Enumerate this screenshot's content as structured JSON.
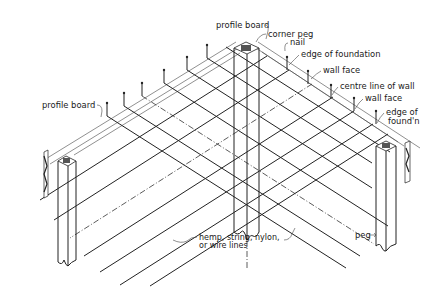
{
  "figure": {
    "type": "isometric construction diagram"
  },
  "labels": {
    "profile_board_top": "profile board",
    "corner_peg": "corner peg",
    "nail": "nail",
    "edge_of_foundation": "edge of foundation",
    "wall_face_1": "wall face",
    "centre_line_of_wall": "centre line of wall",
    "wall_face_2": "wall face",
    "edge_of_foundn_line1": "edge of",
    "edge_of_foundn_line2": "found'n",
    "profile_board_left": "profile board",
    "lines_line1": "hemp, string, nylon,",
    "lines_line2": "or wire lines",
    "peg": "peg"
  },
  "colors": {
    "ink": "#222222",
    "background": "#ffffff"
  }
}
